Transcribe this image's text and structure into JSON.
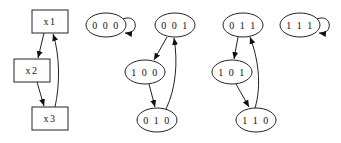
{
  "diagram": {
    "type": "state-transition-graph",
    "left_graph": {
      "nodes": [
        {
          "id": "x1",
          "label": "x1",
          "shape": "box"
        },
        {
          "id": "x2",
          "label": "x2",
          "shape": "box"
        },
        {
          "id": "x3",
          "label": "x3",
          "shape": "box"
        }
      ],
      "edges": [
        {
          "from": "x1",
          "to": "x2"
        },
        {
          "from": "x2",
          "to": "x3"
        },
        {
          "from": "x3",
          "to": "x1"
        }
      ]
    },
    "state_graph": {
      "nodes": [
        {
          "id": "000",
          "label": "0 0 0"
        },
        {
          "id": "001",
          "label": "0 0 1"
        },
        {
          "id": "100",
          "label": "1 0 0"
        },
        {
          "id": "010",
          "label": "0 1 0"
        },
        {
          "id": "011",
          "label": "0 1 1"
        },
        {
          "id": "101",
          "label": "1 0 1"
        },
        {
          "id": "110",
          "label": "1 1 0"
        },
        {
          "id": "111",
          "label": "1 1 1"
        }
      ],
      "edges": [
        {
          "from": "000",
          "to": "000"
        },
        {
          "from": "001",
          "to": "100"
        },
        {
          "from": "100",
          "to": "010"
        },
        {
          "from": "010",
          "to": "001"
        },
        {
          "from": "011",
          "to": "101"
        },
        {
          "from": "101",
          "to": "110"
        },
        {
          "from": "110",
          "to": "011"
        },
        {
          "from": "111",
          "to": "111"
        }
      ]
    }
  }
}
